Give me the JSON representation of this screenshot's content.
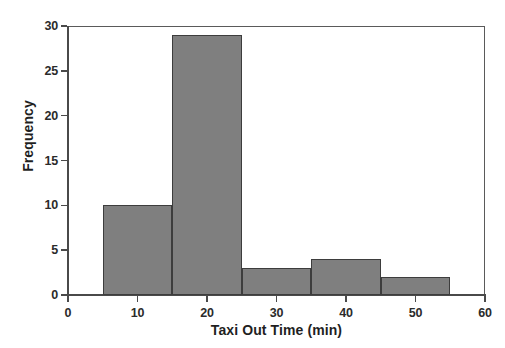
{
  "chart_data": {
    "type": "bar",
    "title": "",
    "subtitle": "",
    "xlabel": "Taxi Out Time (min)",
    "ylabel": "Frequency",
    "xlim": [
      0,
      60
    ],
    "ylim": [
      0,
      30
    ],
    "xticks": [
      0,
      10,
      20,
      30,
      40,
      50,
      60
    ],
    "yticks": [
      0,
      5,
      10,
      15,
      20,
      25,
      30
    ],
    "grid": false,
    "legend": null,
    "bin_width": 10,
    "bin_edges": [
      5,
      15,
      25,
      35,
      45,
      55
    ],
    "categories": [
      "5-15",
      "15-25",
      "25-35",
      "35-45",
      "45-55"
    ],
    "values": [
      10,
      29,
      3,
      4,
      2
    ],
    "bars": [
      {
        "x0": 5,
        "x1": 15,
        "frequency": 10
      },
      {
        "x0": 15,
        "x1": 25,
        "frequency": 29
      },
      {
        "x0": 25,
        "x1": 35,
        "frequency": 3
      },
      {
        "x0": 35,
        "x1": 45,
        "frequency": 4
      },
      {
        "x0": 45,
        "x1": 55,
        "frequency": 2
      }
    ],
    "total_count": 48,
    "colors": {
      "bar_fill": "#7f7f7f",
      "bar_edge": "#3d3d3d",
      "axis": "#4a4a4a",
      "text": "#1f1f1f",
      "background": "#ffffff"
    }
  },
  "axis": {
    "x_tick_labels": [
      "0",
      "10",
      "20",
      "30",
      "40",
      "50",
      "60"
    ],
    "y_tick_labels": [
      "0",
      "5",
      "10",
      "15",
      "20",
      "25",
      "30"
    ],
    "x_title": "Taxi Out Time (min)",
    "y_title": "Frequency"
  }
}
